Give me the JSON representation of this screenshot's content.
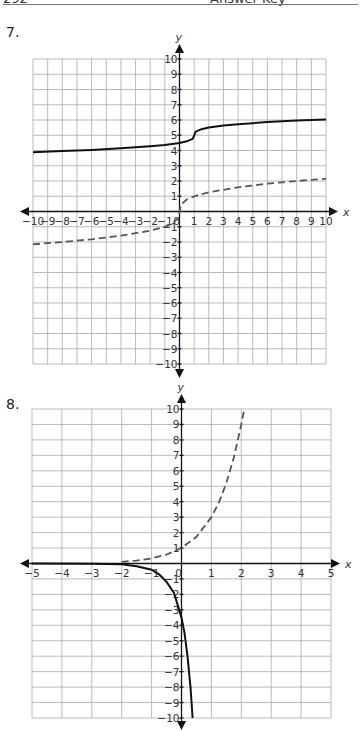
{
  "header": {
    "page_number": "292",
    "title": "Answer Key"
  },
  "chart_data": [
    {
      "problem": "7.",
      "type": "line",
      "title": "",
      "xlabel": "x",
      "ylabel": "y",
      "xlim": [
        -10,
        10
      ],
      "ylim": [
        -10,
        10
      ],
      "grid": true,
      "x_ticks": [
        -10,
        -9,
        -8,
        -7,
        -6,
        -5,
        -4,
        -3,
        -2,
        -1,
        0,
        1,
        2,
        3,
        4,
        5,
        6,
        7,
        8,
        9,
        10
      ],
      "y_ticks": [
        -10,
        -9,
        -8,
        -7,
        -6,
        -5,
        -4,
        -3,
        -2,
        -1,
        1,
        2,
        3,
        4,
        5,
        6,
        7,
        8,
        9,
        10
      ],
      "box": {
        "left": 33,
        "right": 326,
        "top": 59,
        "bottom": 364
      },
      "arrows": {
        "x_left": 20,
        "x_right": 338,
        "y_top": 44,
        "y_bottom": 378
      },
      "series": [
        {
          "name": "y = 1/2 ∛(x − 1) + 5",
          "style": "solid",
          "function": "cbrt_shift",
          "x": [
            -10,
            -8,
            -6,
            -4,
            -2,
            -1,
            0,
            0.5,
            0.9,
            1,
            1.1,
            1.5,
            2,
            3,
            4,
            6,
            8,
            10
          ],
          "y": [
            3.89,
            3.96,
            4.04,
            4.15,
            4.28,
            4.37,
            4.5,
            4.6,
            4.77,
            5.0,
            5.23,
            5.4,
            5.5,
            5.63,
            5.72,
            5.86,
            5.96,
            6.04
          ]
        },
        {
          "name": "y = ∛x",
          "style": "dashed",
          "function": "cbrt",
          "x": [
            -10,
            -8,
            -6,
            -4,
            -2,
            -1,
            -0.5,
            -0.1,
            0,
            0.1,
            0.5,
            1,
            2,
            4,
            6,
            8,
            10
          ],
          "y": [
            -2.15,
            -2.0,
            -1.82,
            -1.59,
            -1.26,
            -1.0,
            -0.79,
            -0.46,
            0,
            0.46,
            0.79,
            1.0,
            1.26,
            1.59,
            1.82,
            2.0,
            2.15
          ]
        }
      ]
    },
    {
      "problem": "8.",
      "type": "line",
      "title": "",
      "xlabel": "x",
      "ylabel": "y",
      "xlim": [
        -5,
        5
      ],
      "ylim": [
        -10,
        10
      ],
      "grid": true,
      "x_ticks": [
        -5,
        -4,
        -3,
        -2,
        -1,
        0,
        1,
        2,
        3,
        4,
        5
      ],
      "y_ticks": [
        -10,
        -9,
        -8,
        -7,
        -6,
        -5,
        -4,
        -3,
        -2,
        -1,
        1,
        2,
        3,
        4,
        5,
        6,
        7,
        8,
        9,
        10
      ],
      "box": {
        "left": 32,
        "right": 331,
        "top": 409,
        "bottom": 718
      },
      "arrows": {
        "x_left": 20,
        "x_right": 340,
        "y_top": 394,
        "y_bottom": 730
      },
      "series": [
        {
          "name": "y = 3^x",
          "style": "dashed",
          "function": "exp3",
          "x": [
            -2,
            -1.5,
            -1,
            -0.5,
            0,
            0.5,
            1,
            1.25,
            1.5,
            1.75,
            2.0,
            2.1
          ],
          "y": [
            0.11,
            0.19,
            0.33,
            0.58,
            1.0,
            1.73,
            3.0,
            3.95,
            5.2,
            6.84,
            9.0,
            10.0
          ]
        },
        {
          "name": "y = −3.3·e^(3x)",
          "style": "solid",
          "function": "neg_exp",
          "x": [
            -5,
            -3,
            -2,
            -1.5,
            -1,
            -0.75,
            -0.5,
            -0.25,
            0,
            0.1,
            0.2,
            0.3,
            0.37
          ],
          "y": [
            0,
            -0.01,
            -0.05,
            -0.18,
            -0.4,
            -0.7,
            -1.2,
            -1.9,
            -3.5,
            -4.5,
            -6.0,
            -8.0,
            -10.0
          ]
        }
      ]
    }
  ]
}
